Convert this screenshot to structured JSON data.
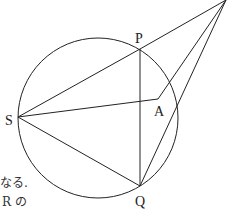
{
  "diagram": {
    "stroke_color": "#222222",
    "circle": {
      "cx": 98,
      "cy": 118,
      "r": 80
    },
    "points": {
      "P": {
        "label": "P",
        "x": 140,
        "y": 49
      },
      "S": {
        "label": "S",
        "x": 18,
        "y": 117
      },
      "A": {
        "label": "A",
        "x": 158,
        "y": 99
      },
      "Q": {
        "label": "Q",
        "x": 140,
        "y": 186
      },
      "R": {
        "label": "",
        "x": 226,
        "y": 0
      }
    },
    "segments": [
      [
        "S",
        "P"
      ],
      [
        "S",
        "A"
      ],
      [
        "S",
        "Q"
      ],
      [
        "P",
        "Q"
      ],
      [
        "P",
        "R"
      ],
      [
        "A",
        "R"
      ],
      [
        "Q",
        "R"
      ]
    ]
  },
  "text_fragments": {
    "line1": "なる.",
    "line2": "R の"
  }
}
